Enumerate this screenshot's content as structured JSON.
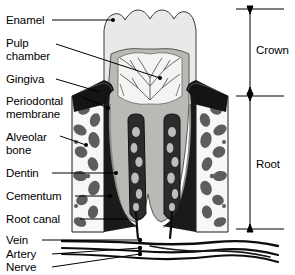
{
  "figure": {
    "type": "anatomical-diagram",
    "background_color": "#ffffff",
    "line_color": "#000000"
  },
  "labels_left": [
    {
      "id": "enamel",
      "text": "Enamel",
      "x": 6,
      "y": 16
    },
    {
      "id": "pulp-chamber-line1",
      "text": "Pulp",
      "x": 6,
      "y": 39
    },
    {
      "id": "pulp-chamber-line2",
      "text": "chamber",
      "x": 6,
      "y": 52
    },
    {
      "id": "gingiva",
      "text": "Gingiva",
      "x": 6,
      "y": 75
    },
    {
      "id": "periodontal-line1",
      "text": "Periodontal",
      "x": 6,
      "y": 97
    },
    {
      "id": "periodontal-line2",
      "text": "membrane",
      "x": 6,
      "y": 110
    },
    {
      "id": "alveolar-line1",
      "text": "Alveolar",
      "x": 6,
      "y": 133
    },
    {
      "id": "alveolar-line2",
      "text": "bone",
      "x": 6,
      "y": 146
    },
    {
      "id": "dentin",
      "text": "Dentin",
      "x": 6,
      "y": 169
    },
    {
      "id": "cementum",
      "text": "Cementum",
      "x": 6,
      "y": 192
    },
    {
      "id": "root-canal",
      "text": "Root canal",
      "x": 6,
      "y": 215
    },
    {
      "id": "vein",
      "text": "Vein",
      "x": 6,
      "y": 237
    },
    {
      "id": "artery",
      "text": "Artery",
      "x": 6,
      "y": 251
    },
    {
      "id": "nerve",
      "text": "Nerve",
      "x": 6,
      "y": 264
    }
  ],
  "labels_right": [
    {
      "id": "crown",
      "text": "Crown",
      "x": 250,
      "y": 44,
      "bracket_top": 9,
      "bracket_bottom": 92
    },
    {
      "id": "root",
      "text": "Root",
      "x": 250,
      "y": 158,
      "bracket_top": 96,
      "bracket_bottom": 229
    }
  ],
  "structures": {
    "enamel": {
      "name": "Enamel",
      "color": "#e9e9e7"
    },
    "dentin": {
      "name": "Dentin",
      "color": "#b9b9b6"
    },
    "pulp_chamber": {
      "name": "Pulp chamber",
      "color": "#f4f4f2"
    },
    "root_canal": {
      "name": "Root canal",
      "color": "#2b2b2b"
    },
    "gingiva": {
      "name": "Gingiva",
      "color": "#141414"
    },
    "periodontal": {
      "name": "Periodontal membrane",
      "color": "#1a1a1a"
    },
    "alveolar_bone": {
      "name": "Alveolar bone",
      "color": "#f7f7f5"
    },
    "trabeculae": {
      "name": "Bone trabeculae",
      "color": "#5d5d5d"
    },
    "cementum": {
      "name": "Cementum",
      "color": "#8d8d8a"
    },
    "vessels": {
      "name": "Vein / artery / nerve bundle",
      "color": "#0d0d0d"
    }
  }
}
